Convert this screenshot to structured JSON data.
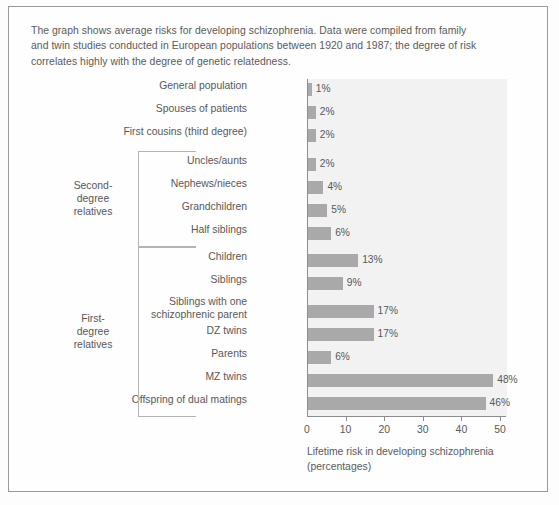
{
  "caption": "The graph shows average risks for developing schizophrenia. Data were compiled from family and twin studies conducted in European populations between 1920 and 1987; the degree of risk correlates highly with the degree of genetic relatedness.",
  "groups": [
    {
      "name": "second-degree-relatives",
      "label": "Second-\ndegree\nrelatives"
    },
    {
      "name": "first-degree-relatives",
      "label": "First-\ndegree\nrelatives"
    }
  ],
  "chart_data": {
    "type": "bar",
    "orientation": "horizontal",
    "title": "",
    "xlabel": "Lifetime risk in developing schizophrenia\n(percentages)",
    "ylabel": "",
    "xlim": [
      0,
      55
    ],
    "xticks": [
      0,
      10,
      20,
      30,
      40,
      50
    ],
    "xtick_labels": [
      "0",
      "10",
      "20",
      "30",
      "40",
      "50"
    ],
    "grid": false,
    "legend": "none",
    "bar_color": "#a9a9a9",
    "plot_background": "#f2f2f2",
    "categories": [
      "General population",
      "Spouses of patients",
      "First cousins (third degree)",
      "Uncles/aunts",
      "Nephews/nieces",
      "Grandchildren",
      "Half siblings",
      "Children",
      "Siblings",
      "Siblings with one\nschizophrenic parent",
      "DZ twins",
      "Parents",
      "MZ twins",
      "Offspring of dual matings"
    ],
    "values": [
      1,
      2,
      2,
      2,
      4,
      5,
      6,
      13,
      9,
      17,
      17,
      6,
      48,
      46
    ],
    "value_labels": [
      "1%",
      "2%",
      "2%",
      "2%",
      "4%",
      "5%",
      "6%",
      "13%",
      "9%",
      "17%",
      "17%",
      "6%",
      "48%",
      "46%"
    ]
  },
  "x_axis_title_line1": "Lifetime risk in developing schizophrenia",
  "x_axis_title_line2": "(percentages)"
}
